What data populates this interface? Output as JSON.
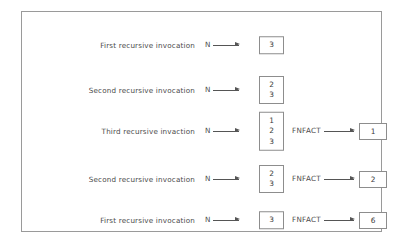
{
  "figure": {
    "border_color": "#9a9a9a",
    "box_border_color": "#8d8d8d",
    "arrow_color": "#555555",
    "text_color": "#4a4a4a"
  },
  "rows": [
    {
      "label": "First recursive invocation",
      "indent_px": 0,
      "center_y": 33,
      "n_label": "N",
      "n_arrow": "arrow-right",
      "stack": [
        "3"
      ],
      "result_label": "FNFACT",
      "result_arrow": "arrow-right",
      "result_value": "",
      "has_result": false
    },
    {
      "label": "Second recursive invocation",
      "indent_px": 0,
      "center_y": 78,
      "n_label": "N",
      "n_arrow": "arrow-right",
      "stack": [
        "2",
        "3"
      ],
      "result_label": "FNFACT",
      "result_arrow": "arrow-right",
      "result_value": "",
      "has_result": false
    },
    {
      "label": "Third recursive invaction",
      "indent_px": 0,
      "center_y": 119,
      "n_label": "N",
      "n_arrow": "arrow-right",
      "stack": [
        "1",
        "2",
        "3"
      ],
      "result_label": "FNFACT",
      "result_arrow": "arrow-right",
      "result_value": "1",
      "has_result": true
    },
    {
      "label": "Second recursive invocation",
      "indent_px": 0,
      "center_y": 167,
      "n_label": "N",
      "n_arrow": "arrow-right",
      "stack": [
        "2",
        "3"
      ],
      "result_label": "FNFACT",
      "result_arrow": "arrow-right",
      "result_value": "2",
      "has_result": true
    },
    {
      "label": "First recursive invocation",
      "indent_px": 0,
      "center_y": 208,
      "n_label": "N",
      "n_arrow": "arrow-right",
      "stack": [
        "3"
      ],
      "result_label": "FNFACT",
      "result_arrow": "arrow-right",
      "result_value": "6",
      "has_result": true
    }
  ]
}
